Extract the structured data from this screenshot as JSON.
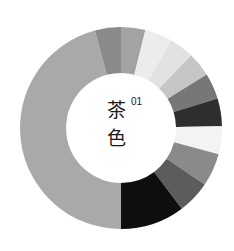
{
  "chart_data": {
    "type": "pie",
    "variant": "donut",
    "index_label": "01",
    "center": [
      121,
      128
    ],
    "outer_radius": 101,
    "inner_radius": 55,
    "start_angle_deg": 0,
    "direction": "clockwise",
    "segments": [
      {
        "start": 0,
        "end": 14,
        "color": "#a3a3a3"
      },
      {
        "start": 14,
        "end": 30,
        "color": "#ececec"
      },
      {
        "start": 30,
        "end": 44,
        "color": "#e2e2e2"
      },
      {
        "start": 44,
        "end": 58,
        "color": "#c6c6c6"
      },
      {
        "start": 58,
        "end": 73,
        "color": "#777777"
      },
      {
        "start": 73,
        "end": 89,
        "color": "#2e2e2e"
      },
      {
        "start": 89,
        "end": 105,
        "color": "#f3f3f3"
      },
      {
        "start": 105,
        "end": 124,
        "color": "#8a8a8a"
      },
      {
        "start": 124,
        "end": 143,
        "color": "#5c5c5c"
      },
      {
        "start": 143,
        "end": 180,
        "color": "#0e0e0e"
      },
      {
        "start": 180,
        "end": 345,
        "color": "#a9a9a9"
      },
      {
        "start": 345,
        "end": 360,
        "color": "#8a8a8a"
      }
    ],
    "values": [
      14,
      16,
      14,
      14,
      15,
      16,
      16,
      19,
      19,
      37,
      165,
      15
    ],
    "legend": [],
    "xlabel": "",
    "ylabel": ""
  },
  "center_text": {
    "char1": "茶",
    "char2": "色",
    "number": "01"
  }
}
